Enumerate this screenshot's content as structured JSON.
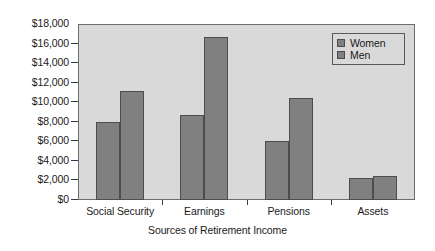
{
  "chart_data": {
    "type": "bar",
    "title": "",
    "xlabel": "Sources of Retirement Income",
    "ylabel": "",
    "categories": [
      "Social Security",
      "Earnings",
      "Pensions",
      "Assets"
    ],
    "series": [
      {
        "name": "Women",
        "values": [
          7950,
          8650,
          6000,
          2250
        ]
      },
      {
        "name": "Men",
        "values": [
          11200,
          16700,
          10450,
          2500
        ]
      }
    ],
    "ylim": [
      0,
      18000
    ],
    "ytick_values": [
      0,
      2000,
      4000,
      6000,
      8000,
      10000,
      12000,
      14000,
      16000,
      18000
    ],
    "ytick_labels": [
      "$0",
      "$2,000",
      "$4,000",
      "$6,000",
      "$8,000",
      "$10,000",
      "$12,000",
      "$14,000",
      "$16,000",
      "$18,000"
    ],
    "grid": false,
    "legend_position": "top-right",
    "legend_entries": [
      "Women",
      "Men"
    ],
    "colors": {
      "bar_fill": "#808080",
      "bar_border": "#4d4d4d",
      "plot_background": "#d9d9d9",
      "plot_border": "#6e6e6e",
      "figure_background": "#ffffff",
      "text": "#1a1a1a"
    }
  }
}
